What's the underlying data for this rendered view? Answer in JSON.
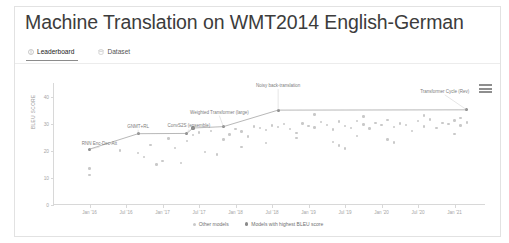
{
  "header": {
    "title": "Machine Translation on WMT2014 English-German"
  },
  "tabs": [
    {
      "label": "Leaderboard",
      "icon": "trophy-icon",
      "active": true
    },
    {
      "label": "Dataset",
      "icon": "database-icon",
      "active": false
    }
  ],
  "chart_toolbar": {
    "menu_label": "hamburger-menu-icon"
  },
  "legend": [
    {
      "label": "Other models",
      "kind": "other"
    },
    {
      "label": "Models with highest BLEU score",
      "kind": "sota"
    }
  ],
  "chart_data": {
    "type": "scatter",
    "title": "",
    "xlabel": "",
    "ylabel": "BLEU SCORE",
    "ylim": [
      0,
      45
    ],
    "yticks": [
      0,
      10,
      20,
      30,
      40
    ],
    "xlim": [
      "2015-07",
      "2021-06"
    ],
    "xticks": [
      "Jan '16",
      "Jul '16",
      "Jan '17",
      "Jul '17",
      "Jan '18",
      "Jul '18",
      "Jan '19",
      "Jul '19",
      "Jan '20",
      "Jul '20",
      "Jan '21"
    ],
    "grid": false,
    "legend_position": "bottom",
    "series": [
      {
        "name": "Models with highest BLEU score",
        "color": "#8a8a8a",
        "points": [
          {
            "x": "2016-01",
            "y": 20.6,
            "label": "RNN Enc-Dec-Att"
          },
          {
            "x": "2016-09",
            "y": 26.3,
            "label": "GNMT+RL"
          },
          {
            "x": "2017-05",
            "y": 26.4,
            "label": "ConvS2S (ensemble)"
          },
          {
            "x": "2017-06",
            "y": 28.4,
            "label": ""
          },
          {
            "x": "2017-11",
            "y": 28.9,
            "label": "Weighted Transformer (large)"
          },
          {
            "x": "2018-08",
            "y": 35.0,
            "label": "Noisy back-translation"
          },
          {
            "x": "2021-03",
            "y": 35.1,
            "label": "Transformer Cycle (Rev)"
          }
        ]
      },
      {
        "name": "Other models",
        "color": "#c9c9c9",
        "points": [
          {
            "x": "2016-01",
            "y": 13.5
          },
          {
            "x": "2016-01",
            "y": 11.1
          },
          {
            "x": "2016-06",
            "y": 20.1
          },
          {
            "x": "2016-09",
            "y": 19.2
          },
          {
            "x": "2016-10",
            "y": 17.8
          },
          {
            "x": "2016-11",
            "y": 22.1
          },
          {
            "x": "2017-01",
            "y": 16.3
          },
          {
            "x": "2017-02",
            "y": 24.5
          },
          {
            "x": "2017-03",
            "y": 21.0
          },
          {
            "x": "2017-05",
            "y": 23.6
          },
          {
            "x": "2017-06",
            "y": 25.8
          },
          {
            "x": "2017-07",
            "y": 26.8
          },
          {
            "x": "2017-09",
            "y": 27.4
          },
          {
            "x": "2017-11",
            "y": 24.1
          },
          {
            "x": "2017-12",
            "y": 26.0
          },
          {
            "x": "2018-01",
            "y": 28.1
          },
          {
            "x": "2018-02",
            "y": 27.1
          },
          {
            "x": "2018-03",
            "y": 25.2
          },
          {
            "x": "2018-04",
            "y": 29.0
          },
          {
            "x": "2018-05",
            "y": 28.3
          },
          {
            "x": "2018-06",
            "y": 27.6
          },
          {
            "x": "2018-07",
            "y": 29.3
          },
          {
            "x": "2018-08",
            "y": 28.7
          },
          {
            "x": "2018-09",
            "y": 29.9
          },
          {
            "x": "2018-10",
            "y": 28.0
          },
          {
            "x": "2018-11",
            "y": 26.5
          },
          {
            "x": "2018-12",
            "y": 30.1
          },
          {
            "x": "2019-01",
            "y": 29.2
          },
          {
            "x": "2019-02",
            "y": 28.6
          },
          {
            "x": "2019-03",
            "y": 30.6
          },
          {
            "x": "2019-04",
            "y": 29.5
          },
          {
            "x": "2019-05",
            "y": 27.9
          },
          {
            "x": "2019-06",
            "y": 30.8
          },
          {
            "x": "2019-07",
            "y": 29.1
          },
          {
            "x": "2019-08",
            "y": 28.4
          },
          {
            "x": "2019-09",
            "y": 31.0
          },
          {
            "x": "2019-10",
            "y": 29.7
          },
          {
            "x": "2019-11",
            "y": 28.2
          },
          {
            "x": "2019-12",
            "y": 30.3
          },
          {
            "x": "2020-01",
            "y": 29.4
          },
          {
            "x": "2020-02",
            "y": 31.3
          },
          {
            "x": "2020-03",
            "y": 28.8
          },
          {
            "x": "2020-04",
            "y": 30.0
          },
          {
            "x": "2020-05",
            "y": 29.6
          },
          {
            "x": "2020-06",
            "y": 27.3
          },
          {
            "x": "2020-07",
            "y": 30.9
          },
          {
            "x": "2020-08",
            "y": 29.0
          },
          {
            "x": "2020-09",
            "y": 31.6
          },
          {
            "x": "2020-10",
            "y": 28.5
          },
          {
            "x": "2020-11",
            "y": 30.2
          },
          {
            "x": "2020-12",
            "y": 29.8
          },
          {
            "x": "2021-01",
            "y": 31.1
          },
          {
            "x": "2021-02",
            "y": 29.3
          },
          {
            "x": "2021-03",
            "y": 30.5
          },
          {
            "x": "2017-08",
            "y": 19.5
          },
          {
            "x": "2017-10",
            "y": 18.6
          },
          {
            "x": "2018-02",
            "y": 21.4
          },
          {
            "x": "2018-06",
            "y": 22.8
          },
          {
            "x": "2019-05",
            "y": 23.3
          },
          {
            "x": "2019-06",
            "y": 22.0
          },
          {
            "x": "2019-07",
            "y": 20.8
          },
          {
            "x": "2020-02",
            "y": 24.2
          },
          {
            "x": "2020-03",
            "y": 23.0
          },
          {
            "x": "2016-12",
            "y": 14.9
          },
          {
            "x": "2017-04",
            "y": 15.6
          },
          {
            "x": "2018-11",
            "y": 24.8
          },
          {
            "x": "2019-09",
            "y": 25.5
          },
          {
            "x": "2021-01",
            "y": 26.2
          },
          {
            "x": "2019-02",
            "y": 33.4
          },
          {
            "x": "2019-10",
            "y": 32.6
          },
          {
            "x": "2020-08",
            "y": 33.0
          },
          {
            "x": "2021-02",
            "y": 32.2
          }
        ]
      }
    ],
    "annotations": [
      "RNN Enc-Dec-Att",
      "GNMT+RL",
      "ConvS2S (ensemble)",
      "Weighted Transformer (large)",
      "Noisy back-translation",
      "Transformer Cycle (Rev)"
    ]
  }
}
